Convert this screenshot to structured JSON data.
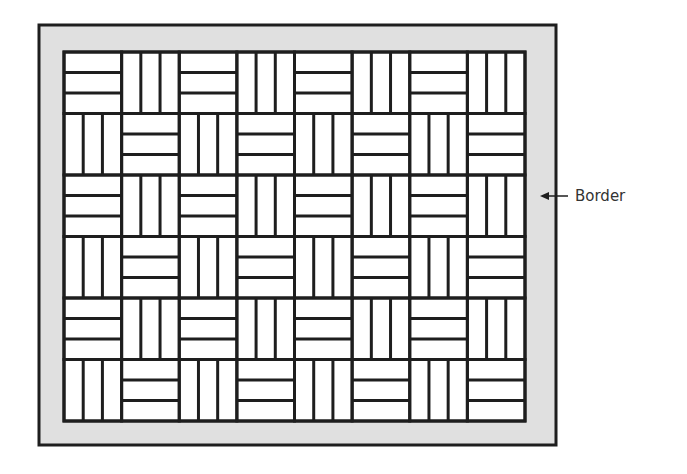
{
  "diagram": {
    "colors": {
      "line": "#1e1e1e",
      "border_fill": "#e0e0e0",
      "tile_fill": "#ffffff",
      "label_text": "#333333"
    },
    "outer_frame": {
      "x": 39,
      "y": 25,
      "width": 517,
      "height": 420
    },
    "inner_field": {
      "x": 64,
      "y": 52,
      "width": 461,
      "height": 369
    },
    "grid": {
      "columns": 8,
      "rows": 6,
      "strips_per_tile": 3,
      "pattern": "checkerboard",
      "pattern_rule": "tile is horizontal when (row + column) is even, vertical otherwise",
      "tiles": [
        [
          "H",
          "V",
          "H",
          "V",
          "H",
          "V",
          "H",
          "V"
        ],
        [
          "V",
          "H",
          "V",
          "H",
          "V",
          "H",
          "V",
          "H"
        ],
        [
          "H",
          "V",
          "H",
          "V",
          "H",
          "V",
          "H",
          "V"
        ],
        [
          "V",
          "H",
          "V",
          "H",
          "V",
          "H",
          "V",
          "H"
        ],
        [
          "H",
          "V",
          "H",
          "V",
          "H",
          "V",
          "H",
          "V"
        ],
        [
          "V",
          "H",
          "V",
          "H",
          "V",
          "H",
          "V",
          "H"
        ]
      ]
    },
    "annotation": {
      "label": "Border",
      "arrow": {
        "from_x": 568,
        "to_x": 540,
        "y": 196
      }
    }
  }
}
